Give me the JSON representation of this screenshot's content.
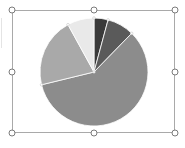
{
  "chart_data": {
    "type": "pie",
    "title": "",
    "legend": "none",
    "labels": [
      "Slice 1",
      "Slice 2",
      "Slice 3",
      "Slice 4",
      "Slice 5"
    ],
    "values": [
      4.2,
      8.1,
      58.9,
      20.8,
      8.0
    ],
    "colors": [
      "#3a3a3a",
      "#5a5a5a",
      "#8c8c8c",
      "#a9a9a9",
      "#e9e9e9"
    ],
    "start_angle_deg": 0,
    "direction": "clockwise",
    "center": [
      94,
      72
    ],
    "radius": 54
  },
  "selection": {
    "frame": {
      "x": 12,
      "y": 10,
      "w": 163,
      "h": 123
    },
    "handles": [
      "top-left",
      "top-center",
      "top-right",
      "middle-left",
      "middle-right",
      "bottom-left",
      "bottom-center",
      "bottom-right"
    ]
  },
  "colors": {
    "frame_border": "#a9a9a9",
    "handle_border": "#7b7b7b",
    "background": "#ffffff"
  }
}
